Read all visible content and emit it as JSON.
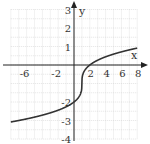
{
  "chart_data": {
    "type": "line",
    "title": "",
    "xlabel": "x",
    "ylabel": "y",
    "xlim": [
      -8,
      8
    ],
    "ylim": [
      -4,
      3
    ],
    "grid": true,
    "x_ticks": [
      -6,
      -2,
      2,
      4,
      6,
      8
    ],
    "y_ticks": [
      3,
      2,
      1,
      -2,
      -3,
      -4
    ],
    "function": "y = cbrt(x - 1) - 1",
    "series": [
      {
        "name": "f(x)",
        "x": [
          -8,
          -6,
          -4,
          -2,
          0,
          0.5,
          1,
          1.5,
          2,
          4,
          6,
          8
        ],
        "y": [
          -3.08,
          -2.91,
          -2.71,
          -2.44,
          -2.0,
          -1.79,
          -1.0,
          -0.21,
          0.0,
          0.44,
          0.71,
          0.91
        ]
      }
    ]
  }
}
